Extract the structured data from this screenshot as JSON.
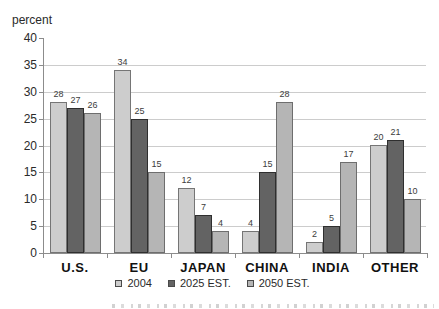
{
  "chart_data": {
    "type": "bar",
    "title": "",
    "ylabel": "percent",
    "xlabel": "",
    "categories": [
      "U.S.",
      "EU",
      "JAPAN",
      "CHINA",
      "INDIA",
      "OTHER"
    ],
    "series": [
      {
        "name": "2004",
        "values": [
          28,
          34,
          12,
          4,
          2,
          20
        ],
        "color": "#cdcdcd",
        "border_color": "#757575"
      },
      {
        "name": "2025 EST.",
        "values": [
          27,
          25,
          7,
          15,
          5,
          21
        ],
        "color": "#636363",
        "border_color": "#2f2f2f"
      },
      {
        "name": "2050 EST.",
        "values": [
          26,
          15,
          4,
          28,
          17,
          10
        ],
        "color": "#b5b5b5",
        "border_color": "#6e6e6e"
      }
    ],
    "ylim": [
      0,
      40
    ],
    "yticks": [
      0,
      5,
      10,
      15,
      20,
      25,
      30,
      35,
      40
    ],
    "grid": "horizontal",
    "grid_color": "#cccccc",
    "axis_color": "#8c8c8c",
    "text_color": "#2a2a2a",
    "legend_position": "bottom-center",
    "bar_value_labels": true
  }
}
